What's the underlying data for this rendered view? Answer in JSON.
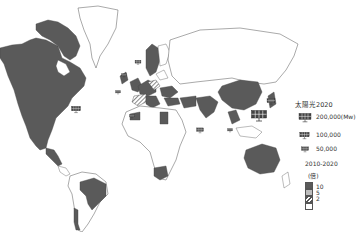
{
  "map": {
    "title": "太陽光2020",
    "projection": "world",
    "colors": {
      "high": "#5a5a5a",
      "mid": "#bdbdbd",
      "low_hatch": "#555555",
      "none": "#ffffff",
      "border": "#444444"
    }
  },
  "legend": {
    "capacity_title": "太陽光2020",
    "capacity_items": [
      {
        "icon": "solar-panel-large-icon",
        "label": "200,000(Mw)"
      },
      {
        "icon": "solar-panel-medium-icon",
        "label": "100,000"
      },
      {
        "icon": "solar-panel-small-icon",
        "label": "50,000"
      }
    ],
    "growth_title": "2010-2020",
    "growth_unit": "(倍)",
    "growth_items": [
      {
        "style": "dark",
        "label": "10"
      },
      {
        "style": "light",
        "label": "5"
      },
      {
        "style": "hatch",
        "label": "2"
      },
      {
        "style": "white",
        "label": ""
      }
    ]
  }
}
